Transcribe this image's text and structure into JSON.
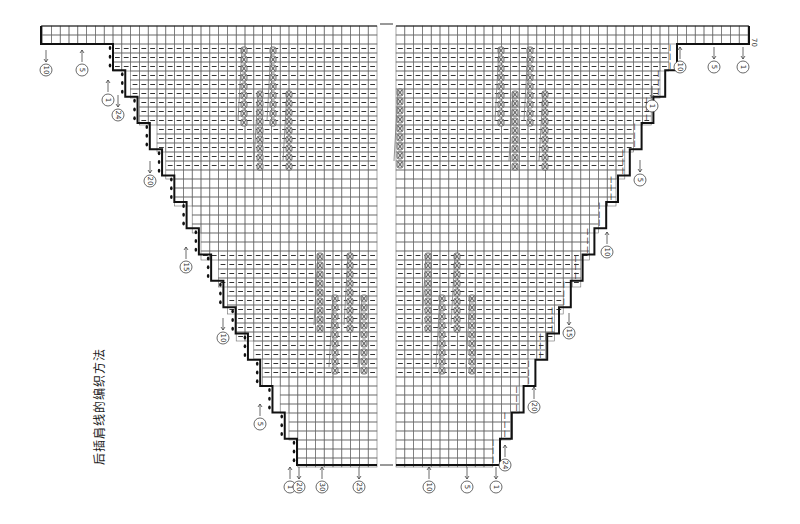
{
  "title": "后插肩线的编织方法",
  "colors": {
    "grid": "#6b6b6b",
    "outline": "#111111",
    "cable": "#555555",
    "text": "#333333"
  },
  "grid": {
    "cell_w": 8.8,
    "cell_h": 9.0,
    "top_y": 26,
    "band_bottom_y": 44,
    "bottom_y": 465,
    "left_half": {
      "x0": 41,
      "x1": 377,
      "edge_start_x": 113,
      "edge_end_x": 297
    },
    "right_half": {
      "x0": 396,
      "x1": 749,
      "edge_start_x": 677,
      "edge_end_x": 500
    },
    "steps": 16,
    "dashed_rows_ranges": [
      [
        44,
        170
      ],
      [
        250,
        375
      ]
    ]
  },
  "row_label_top_right": "70",
  "labels": {
    "top_left": [
      {
        "text": "10",
        "x": 46,
        "y": 70,
        "arrow": "down"
      },
      {
        "text": "5",
        "x": 82,
        "y": 70,
        "arrow": "up"
      }
    ],
    "top_right": [
      {
        "text": "10",
        "x": 680,
        "y": 67,
        "arrow": "up"
      },
      {
        "text": "5",
        "x": 714,
        "y": 67,
        "arrow": "down"
      },
      {
        "text": "1",
        "x": 743,
        "y": 67,
        "arrow": "down"
      }
    ],
    "left_edge": [
      {
        "text": "1",
        "x": 108,
        "y": 100,
        "arrow": "up"
      },
      {
        "text": "24",
        "x": 118,
        "y": 115,
        "arrow": "down"
      },
      {
        "text": "20",
        "x": 150,
        "y": 181,
        "arrow": "down"
      },
      {
        "text": "15",
        "x": 186,
        "y": 267,
        "arrow": "up"
      },
      {
        "text": "10",
        "x": 223,
        "y": 338,
        "arrow": "down"
      },
      {
        "text": "5",
        "x": 260,
        "y": 424,
        "arrow": "up"
      }
    ],
    "right_edge": [
      {
        "text": "1",
        "x": 652,
        "y": 106,
        "arrow": "down"
      },
      {
        "text": "5",
        "x": 640,
        "y": 180,
        "arrow": "down"
      },
      {
        "text": "10",
        "x": 607,
        "y": 252,
        "arrow": "up"
      },
      {
        "text": "15",
        "x": 569,
        "y": 333,
        "arrow": "down"
      },
      {
        "text": "20",
        "x": 534,
        "y": 407,
        "arrow": "up"
      },
      {
        "text": "24",
        "x": 505,
        "y": 465,
        "arrow": "up"
      }
    ],
    "bottom": [
      {
        "text": "1",
        "x": 290,
        "y": 487,
        "arrow": "up"
      },
      {
        "text": "20",
        "x": 299,
        "y": 487,
        "arrow": "down"
      },
      {
        "text": "30",
        "x": 322,
        "y": 487,
        "arrow": "up"
      },
      {
        "text": "25",
        "x": 359,
        "y": 487,
        "arrow": "down"
      },
      {
        "text": "10",
        "x": 429,
        "y": 487,
        "arrow": "up"
      },
      {
        "text": "5",
        "x": 467,
        "y": 487,
        "arrow": "down"
      },
      {
        "text": "1",
        "x": 496,
        "y": 487,
        "arrow": "down"
      }
    ]
  },
  "cables": [
    {
      "x": 244,
      "y0": 46,
      "y1": 126
    },
    {
      "x": 260,
      "y0": 90,
      "y1": 166
    },
    {
      "x": 273,
      "y0": 46,
      "y1": 126
    },
    {
      "x": 289,
      "y0": 90,
      "y1": 166
    },
    {
      "x": 320,
      "y0": 252,
      "y1": 330
    },
    {
      "x": 335,
      "y0": 294,
      "y1": 372
    },
    {
      "x": 350,
      "y0": 252,
      "y1": 330
    },
    {
      "x": 364,
      "y0": 294,
      "y1": 372
    },
    {
      "x": 400,
      "y0": 88,
      "y1": 166
    },
    {
      "x": 501,
      "y0": 46,
      "y1": 126
    },
    {
      "x": 515,
      "y0": 90,
      "y1": 166
    },
    {
      "x": 530,
      "y0": 46,
      "y1": 126
    },
    {
      "x": 545,
      "y0": 90,
      "y1": 166
    },
    {
      "x": 428,
      "y0": 252,
      "y1": 330
    },
    {
      "x": 442,
      "y0": 294,
      "y1": 372
    },
    {
      "x": 457,
      "y0": 252,
      "y1": 330
    },
    {
      "x": 472,
      "y0": 294,
      "y1": 372
    }
  ]
}
